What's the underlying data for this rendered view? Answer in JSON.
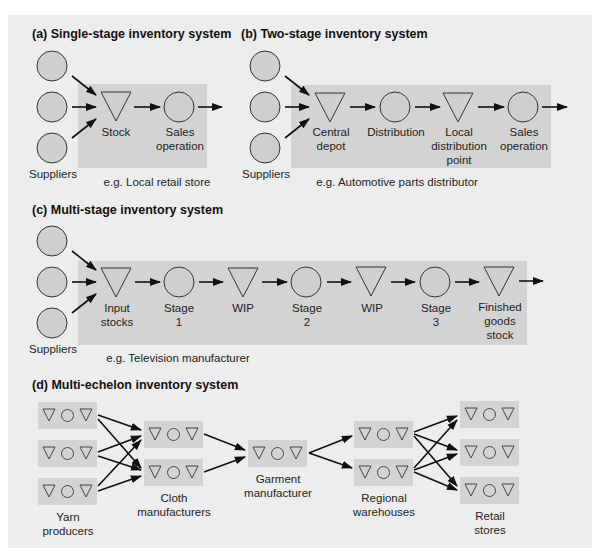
{
  "colors": {
    "panel_bg": "#ededed",
    "shaded_region": "#d3d3d3",
    "node_fill": "#cfcfcf",
    "stroke": "#333333",
    "text": "#1a1a1a"
  },
  "sections": {
    "a": {
      "title": "(a) Single-stage inventory system",
      "suppliers_label": "Suppliers",
      "example": "e.g. Local retail store",
      "nodes": [
        {
          "shape": "triangle",
          "label1": "Stock",
          "label2": ""
        },
        {
          "shape": "circle",
          "label1": "Sales",
          "label2": "operation"
        }
      ]
    },
    "b": {
      "title": "(b) Two-stage inventory system",
      "suppliers_label": "Suppliers",
      "example": "e.g. Automotive parts distributor",
      "nodes": [
        {
          "shape": "triangle",
          "label1": "Central",
          "label2": "depot",
          "label3": ""
        },
        {
          "shape": "circle",
          "label1": "Distribution",
          "label2": "",
          "label3": ""
        },
        {
          "shape": "triangle",
          "label1": "Local",
          "label2": "distribution",
          "label3": "point"
        },
        {
          "shape": "circle",
          "label1": "Sales",
          "label2": "operation",
          "label3": ""
        }
      ]
    },
    "c": {
      "title": "(c) Multi-stage inventory system",
      "suppliers_label": "Suppliers",
      "example": "e.g. Television manufacturer",
      "nodes": [
        {
          "shape": "triangle",
          "label1": "Input",
          "label2": "stocks",
          "label3": ""
        },
        {
          "shape": "circle",
          "label1": "Stage",
          "label2": "1",
          "label3": ""
        },
        {
          "shape": "triangle",
          "label1": "WIP",
          "label2": "",
          "label3": ""
        },
        {
          "shape": "circle",
          "label1": "Stage",
          "label2": "2",
          "label3": ""
        },
        {
          "shape": "triangle",
          "label1": "WIP",
          "label2": "",
          "label3": ""
        },
        {
          "shape": "circle",
          "label1": "Stage",
          "label2": "3",
          "label3": ""
        },
        {
          "shape": "triangle",
          "label1": "Finished",
          "label2": "goods",
          "label3": "stock"
        }
      ]
    },
    "d": {
      "title": "(d) Multi-echelon inventory system",
      "tiers": [
        {
          "label1": "Yarn",
          "label2": "producers",
          "count": 3
        },
        {
          "label1": "Cloth",
          "label2": "manufacturers",
          "count": 2
        },
        {
          "label1": "Garment",
          "label2": "manufacturer",
          "count": 1
        },
        {
          "label1": "Regional",
          "label2": "warehouses",
          "count": 2
        },
        {
          "label1": "Retail",
          "label2": "stores",
          "count": 3
        }
      ],
      "unit_icons": [
        "triangle-icon",
        "circle-icon",
        "triangle-icon"
      ]
    }
  }
}
